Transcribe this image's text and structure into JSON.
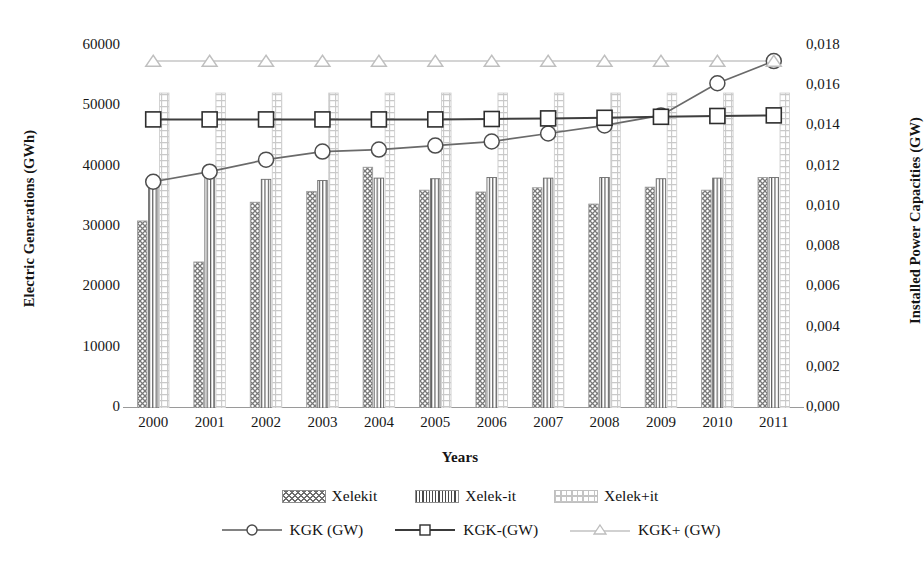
{
  "chart_data": {
    "type": "bar",
    "title": "",
    "xlabel": "Years",
    "ylabel": "Electric Generations (GWh)",
    "ylabel_secondary": "Installed Power Capacities (GW)",
    "categories": [
      "2000",
      "2001",
      "2002",
      "2003",
      "2004",
      "2005",
      "2006",
      "2007",
      "2008",
      "2009",
      "2010",
      "2011"
    ],
    "ylim": [
      0,
      60000
    ],
    "ylim_secondary": [
      0.0,
      0.018
    ],
    "yticks": [
      "0",
      "10000",
      "20000",
      "30000",
      "40000",
      "50000",
      "60000"
    ],
    "ytick_values": [
      0,
      10000,
      20000,
      30000,
      40000,
      50000,
      60000
    ],
    "yticks_secondary": [
      "0,000",
      "0,002",
      "0,004",
      "0,006",
      "0,008",
      "0,010",
      "0,012",
      "0,014",
      "0,016",
      "0,018"
    ],
    "ytick_values_secondary": [
      0.0,
      0.002,
      0.004,
      0.006,
      0.008,
      0.01,
      0.012,
      0.014,
      0.016,
      0.018
    ],
    "grid": false,
    "legend_position": "bottom",
    "series": [
      {
        "name": "Xelekit",
        "kind": "bar",
        "axis": "left",
        "pattern": "cross-hatch",
        "values": [
          31000,
          24200,
          34100,
          35900,
          39900,
          36100,
          35800,
          36500,
          33800,
          36600,
          36100,
          38200
        ]
      },
      {
        "name": "Xelek-it",
        "kind": "bar",
        "axis": "left",
        "pattern": "vertical-lines",
        "values": [
          37400,
          39100,
          37900,
          37700,
          38100,
          38000,
          38200,
          38100,
          38200,
          38000,
          38100,
          38200
        ]
      },
      {
        "name": "Xelek+it",
        "kind": "bar",
        "axis": "left",
        "pattern": "light-grid",
        "values": [
          52200,
          52200,
          52200,
          52200,
          52200,
          52200,
          52200,
          52200,
          52200,
          52200,
          52200,
          52200
        ]
      },
      {
        "name": "KGK (GW)",
        "kind": "line",
        "axis": "right",
        "marker": "circle",
        "values": [
          0.01125,
          0.01175,
          0.01235,
          0.01275,
          0.01285,
          0.01305,
          0.01325,
          0.01365,
          0.01405,
          0.01455,
          0.01615,
          0.01725
        ]
      },
      {
        "name": "KGK-(GW)",
        "kind": "line",
        "axis": "right",
        "marker": "square",
        "values": [
          0.01435,
          0.01435,
          0.01435,
          0.01435,
          0.01435,
          0.01435,
          0.01437,
          0.0144,
          0.01443,
          0.01448,
          0.01452,
          0.01455
        ]
      },
      {
        "name": "KGK+ (GW)",
        "kind": "line",
        "axis": "right",
        "marker": "triangle",
        "values": [
          0.01725,
          0.01725,
          0.01725,
          0.01725,
          0.01725,
          0.01725,
          0.01725,
          0.01725,
          0.01725,
          0.01725,
          0.01725,
          0.01725
        ]
      }
    ]
  },
  "axes": {
    "left_title": "Electric Generations (GWh)",
    "right_title": "Installed Power Capacities (GW)",
    "x_title": "Years"
  },
  "legend": {
    "items": [
      {
        "label": "Xelekit",
        "swatch": "cross-hatch-swatch"
      },
      {
        "label": "Xelek-it",
        "swatch": "vertical-lines-swatch"
      },
      {
        "label": "Xelek+it",
        "swatch": "light-grid-swatch"
      },
      {
        "label": "KGK (GW)",
        "swatch": "circle-marker-line"
      },
      {
        "label": "KGK-(GW)",
        "swatch": "square-marker-line"
      },
      {
        "label": "KGK+ (GW)",
        "swatch": "triangle-marker-line"
      }
    ]
  },
  "colors": {
    "bar_hatch": "#6e6e6e",
    "bar_vertical": "#4a4a4a",
    "bar_light": "#c4c4c4",
    "line_dark": "#595959",
    "line_darker": "#3a3a3a",
    "line_light": "#c2c2c2",
    "axis": "#9a9a9a",
    "text": "#171717"
  }
}
